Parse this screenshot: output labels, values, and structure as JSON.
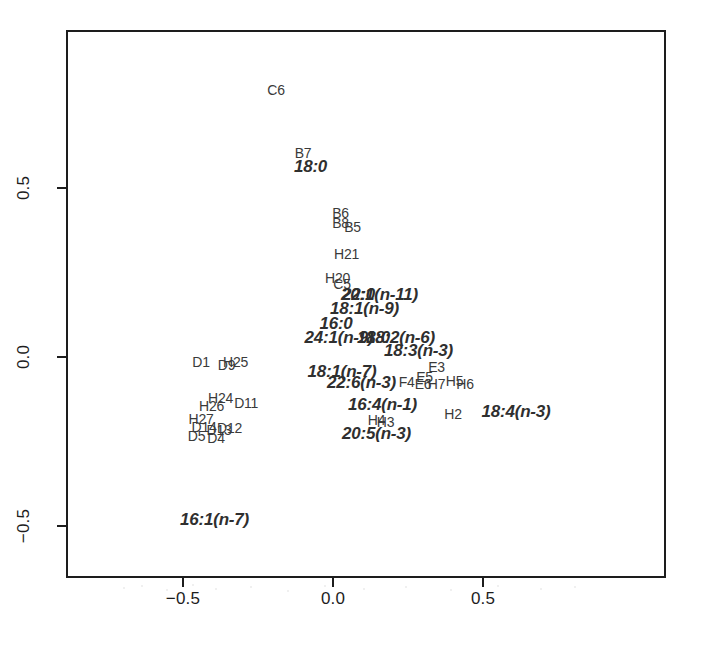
{
  "chart_data": {
    "type": "scatter",
    "title": "",
    "subtitle": "",
    "xlabel": "",
    "ylabel": "",
    "xlim": [
      -0.9,
      0.65
    ],
    "ylim": [
      -0.62,
      0.92
    ],
    "grid": false,
    "legend": null,
    "axes": {
      "x_ticks": [
        -0.5,
        0.0,
        0.5
      ],
      "x_ticklabels": [
        "−0.5",
        "0.0",
        "0.5"
      ],
      "y_ticks": [
        -0.5,
        0.0,
        0.5
      ],
      "y_ticklabels": [
        "−0.5",
        "0.0",
        "0.5"
      ]
    },
    "series": [
      {
        "name": "samples",
        "style": "upright-plain-text-label",
        "points": [
          {
            "label": "C6",
            "x": -0.19,
            "y": 0.79
          },
          {
            "label": "B7",
            "x": -0.1,
            "y": 0.605
          },
          {
            "label": "B6",
            "x": 0.025,
            "y": 0.425
          },
          {
            "label": "B8",
            "x": 0.025,
            "y": 0.395
          },
          {
            "label": "B5",
            "x": 0.065,
            "y": 0.385
          },
          {
            "label": "H21",
            "x": 0.045,
            "y": 0.305
          },
          {
            "label": "H20",
            "x": 0.015,
            "y": 0.235
          },
          {
            "label": "C5",
            "x": 0.03,
            "y": 0.215
          },
          {
            "label": "D1",
            "x": -0.44,
            "y": -0.015
          },
          {
            "label": "D9",
            "x": -0.355,
            "y": -0.025
          },
          {
            "label": "H25",
            "x": -0.325,
            "y": -0.015
          },
          {
            "label": "E3",
            "x": 0.345,
            "y": -0.03
          },
          {
            "label": "E5",
            "x": 0.305,
            "y": -0.06
          },
          {
            "label": "E6",
            "x": 0.3,
            "y": -0.08
          },
          {
            "label": "F4",
            "x": 0.245,
            "y": -0.075
          },
          {
            "label": "H7",
            "x": 0.345,
            "y": -0.08
          },
          {
            "label": "H5",
            "x": 0.405,
            "y": -0.072
          },
          {
            "label": "H6",
            "x": 0.44,
            "y": -0.08
          },
          {
            "label": "D11",
            "x": -0.29,
            "y": -0.135
          },
          {
            "label": "H24",
            "x": -0.375,
            "y": -0.12
          },
          {
            "label": "H26",
            "x": -0.405,
            "y": -0.145
          },
          {
            "label": "H27",
            "x": -0.44,
            "y": -0.182
          },
          {
            "label": "D14",
            "x": -0.43,
            "y": -0.208
          },
          {
            "label": "D13",
            "x": -0.38,
            "y": -0.215
          },
          {
            "label": "D12",
            "x": -0.345,
            "y": -0.21
          },
          {
            "label": "D5",
            "x": -0.455,
            "y": -0.235
          },
          {
            "label": "D4",
            "x": -0.39,
            "y": -0.24
          },
          {
            "label": "H4",
            "x": 0.145,
            "y": -0.185
          },
          {
            "label": "H3",
            "x": 0.175,
            "y": -0.192
          },
          {
            "label": "H2",
            "x": 0.4,
            "y": -0.17
          }
        ]
      },
      {
        "name": "fatty-acid-variables",
        "style": "bold-italic-text-label",
        "points": [
          {
            "label": "18:0",
            "x": -0.075,
            "y": 0.565
          },
          {
            "label": "22:0",
            "x": 0.085,
            "y": 0.185
          },
          {
            "label": "20:1(n-11)",
            "x": 0.155,
            "y": 0.185
          },
          {
            "label": "18:1(n-9)",
            "x": 0.105,
            "y": 0.145
          },
          {
            "label": "16:0",
            "x": 0.01,
            "y": 0.1
          },
          {
            "label": "24:1(n-9)",
            "x": 0.02,
            "y": 0.06
          },
          {
            "label": "18:0",
            "x": 0.135,
            "y": 0.06
          },
          {
            "label": "18:2(n-6)",
            "x": 0.225,
            "y": 0.06
          },
          {
            "label": "18:3(n-3)",
            "x": 0.285,
            "y": 0.02
          },
          {
            "label": "18:1(n-7)",
            "x": 0.03,
            "y": -0.04
          },
          {
            "label": "22:6(n-3)",
            "x": 0.095,
            "y": -0.075
          },
          {
            "label": "16:4(n-1)",
            "x": 0.165,
            "y": -0.14
          },
          {
            "label": "20:5(n-3)",
            "x": 0.145,
            "y": -0.225
          },
          {
            "label": "18:4(n-3)",
            "x": 0.61,
            "y": -0.16
          },
          {
            "label": "16:1(n-7)",
            "x": -0.395,
            "y": -0.48
          }
        ]
      }
    ]
  },
  "plot": {
    "frame": {
      "left": 66,
      "top": 30,
      "width": 600,
      "height": 548
    },
    "mapping": {
      "x_origin_px": 333,
      "x_units_per_px": 300,
      "y_origin_px": 357,
      "y_units_per_px": 338
    }
  }
}
